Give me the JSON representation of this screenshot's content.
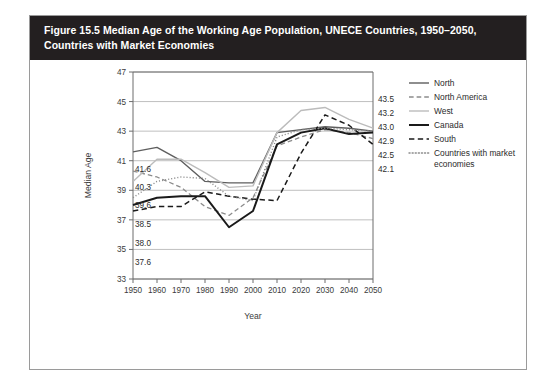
{
  "figure": {
    "title": "Figure 15.5 Median Age of the Working Age Population, UNECE Countries, 1950–2050, Countries with Market Economies"
  },
  "axes": {
    "xlabel": "Year",
    "ylabel": "Median Age",
    "xticks": [
      "1950",
      "1960",
      "1970",
      "1980",
      "1990",
      "2000",
      "2010",
      "2020",
      "2030",
      "2040",
      "2050"
    ],
    "yticks": [
      "33",
      "35",
      "37",
      "39",
      "41",
      "43",
      "45",
      "47"
    ]
  },
  "legend": {
    "items": [
      {
        "label": "North",
        "style": "solid",
        "color": "#5e5e5e",
        "width": 1.4
      },
      {
        "label": "North America",
        "style": "dashed",
        "color": "#8c8c8c",
        "width": 1.3
      },
      {
        "label": "West",
        "style": "solid",
        "color": "#bcbcbc",
        "width": 1.4
      },
      {
        "label": "Canada",
        "style": "solid",
        "color": "#1a1a1a",
        "width": 2.0
      },
      {
        "label": "South",
        "style": "dashed",
        "color": "#1a1a1a",
        "width": 1.5
      },
      {
        "label": "Countries with market economies",
        "style": "dotted",
        "color": "#8c8c8c",
        "width": 1.4
      }
    ],
    "wrapped_second_line": "economies"
  },
  "start_labels": [
    "41.6",
    "40.3",
    "39.6",
    "38.5",
    "38.0",
    "37.6"
  ],
  "end_labels": [
    "43.5",
    "43.2",
    "43.0",
    "42.9",
    "42.5",
    "42.1"
  ],
  "chart_data": {
    "type": "line",
    "title": "Figure 15.5 Median Age of the Working Age Population, UNECE Countries, 1950–2050, Countries with Market Economies",
    "xlabel": "Year",
    "ylabel": "Median Age",
    "xlim": [
      1950,
      2050
    ],
    "ylim": [
      33,
      47
    ],
    "ytick_step": 2,
    "xtick_step": 10,
    "grid": "horizontal",
    "legend_position": "right",
    "x": [
      1950,
      1960,
      1970,
      1980,
      1990,
      2000,
      2010,
      2020,
      2030,
      2040,
      2050
    ],
    "series": [
      {
        "name": "North",
        "style": "solid",
        "color": "#5e5e5e",
        "start_value": 41.6,
        "end_value": 43.0,
        "values": [
          41.6,
          41.9,
          41.0,
          39.6,
          39.5,
          39.5,
          42.9,
          43.1,
          43.3,
          43.2,
          43.0
        ]
      },
      {
        "name": "North America",
        "style": "dashed",
        "color": "#8c8c8c",
        "start_value": 40.3,
        "end_value": 42.5,
        "values": [
          40.3,
          39.9,
          39.2,
          37.9,
          37.3,
          38.5,
          42.0,
          42.6,
          43.1,
          42.9,
          42.5
        ]
      },
      {
        "name": "West",
        "style": "solid",
        "color": "#bcbcbc",
        "start_value": 39.6,
        "end_value": 43.2,
        "values": [
          39.6,
          41.1,
          41.1,
          40.2,
          39.2,
          39.3,
          42.9,
          44.4,
          44.6,
          43.8,
          43.2
        ]
      },
      {
        "name": "Canada",
        "style": "solid",
        "color": "#1a1a1a",
        "start_value": 38.0,
        "end_value": 42.9,
        "values": [
          38.0,
          38.5,
          38.6,
          38.6,
          36.5,
          37.6,
          42.1,
          42.9,
          43.2,
          42.8,
          42.9
        ]
      },
      {
        "name": "South",
        "style": "dashed",
        "color": "#1a1a1a",
        "start_value": 37.6,
        "end_value": 42.1,
        "values": [
          37.6,
          37.9,
          37.9,
          38.9,
          38.6,
          38.4,
          38.3,
          41.5,
          44.1,
          43.4,
          42.1
        ]
      },
      {
        "name": "Countries with market economies",
        "style": "dotted",
        "color": "#8c8c8c",
        "start_value": 38.5,
        "end_value": 43.0,
        "values": [
          38.5,
          39.6,
          39.9,
          39.8,
          38.6,
          38.3,
          42.6,
          43.1,
          43.2,
          43.1,
          43.0
        ]
      }
    ]
  }
}
